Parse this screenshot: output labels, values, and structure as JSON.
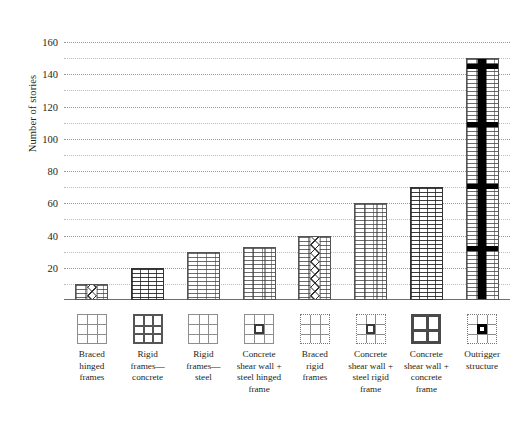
{
  "chart_data": {
    "type": "bar",
    "title": "",
    "xlabel": "",
    "ylabel": "Number of stories",
    "ylim": [
      0,
      170
    ],
    "ytick_labels": [
      "20",
      "40",
      "60",
      "80",
      "100",
      "120",
      "140",
      "160"
    ],
    "ytick_values": [
      20,
      40,
      60,
      80,
      100,
      120,
      140,
      160
    ],
    "gridlines_major": [
      20,
      40,
      60,
      80,
      100,
      120,
      140,
      160
    ],
    "gridlines_minor": [
      10,
      30,
      50,
      70,
      90,
      110,
      130,
      150
    ],
    "grid": true,
    "legend": "none",
    "categories": [
      "Braced hinged frames",
      "Rigid frames—concrete",
      "Rigid frames—steel",
      "Concrete shear wall + steel hinged frame",
      "Braced rigid frames",
      "Concrete shear wall + steel rigid frame",
      "Concrete shear wall + concrete frame",
      "Outrigger structure"
    ],
    "values": [
      10,
      20,
      30,
      33,
      40,
      60,
      70,
      150
    ]
  },
  "axis": {
    "y_title": "Number of stories",
    "ticks": [
      {
        "label": "160",
        "value": 160
      },
      {
        "label": "140",
        "value": 140
      },
      {
        "label": "120",
        "value": 120
      },
      {
        "label": "100",
        "value": 100
      },
      {
        "label": "80",
        "value": 80
      },
      {
        "label": "60",
        "value": 60
      },
      {
        "label": "40",
        "value": 40
      },
      {
        "label": "20",
        "value": 20
      }
    ]
  },
  "bars": [
    {
      "id": "braced-hinged-frames",
      "value": 10,
      "icon": "grid-thin-3x3-icon",
      "label_lines": [
        "Braced",
        "hinged",
        "frames"
      ],
      "texture": "light",
      "core": "x-braced"
    },
    {
      "id": "rigid-frames-concrete",
      "value": 20,
      "icon": "grid-thick-3x3-icon",
      "label_lines": [
        "Rigid",
        "frames—",
        "concrete"
      ],
      "texture": "heavy",
      "core": "plain"
    },
    {
      "id": "rigid-frames-steel",
      "value": 30,
      "icon": "grid-thin-3x3-icon",
      "label_lines": [
        "Rigid",
        "frames—",
        "steel"
      ],
      "texture": "light",
      "core": "plain"
    },
    {
      "id": "concrete-shear-wall-steel-hinged-frame",
      "value": 33,
      "icon": "grid-center-square-icon",
      "label_lines": [
        "Concrete",
        "shear wall +",
        "steel hinged",
        "frame"
      ],
      "texture": "light",
      "core": "solid-lines"
    },
    {
      "id": "braced-rigid-frames",
      "value": 40,
      "icon": "grid-dotted-border-icon",
      "label_lines": [
        "Braced",
        "rigid",
        "frames"
      ],
      "texture": "light",
      "core": "x-braced"
    },
    {
      "id": "concrete-shear-wall-steel-rigid-frame",
      "value": 60,
      "icon": "grid-dotted-center-square-icon",
      "label_lines": [
        "Concrete",
        "shear wall +",
        "steel rigid",
        "frame"
      ],
      "texture": "light",
      "core": "solid-lines"
    },
    {
      "id": "concrete-shear-wall-concrete-frame",
      "value": 70,
      "icon": "grid-bold-2x2-icon",
      "label_lines": [
        "Concrete",
        "shear wall +",
        "concrete",
        "frame"
      ],
      "texture": "heavy",
      "core": "plain"
    },
    {
      "id": "outrigger-structure",
      "value": 150,
      "icon": "grid-dotted-bold-center-icon",
      "label_lines": [
        "Outrigger",
        "structure"
      ],
      "texture": "light",
      "core": "solid-black-outrigger"
    }
  ],
  "colors": {
    "ink": "#231f20",
    "grid": "#9a9a9a",
    "grid_minor": "#bdbdbd",
    "bar_line": "#6b6b6b",
    "bar_line_heavy": "#3c3c3c",
    "core_black": "#000000",
    "background": "#ffffff"
  }
}
